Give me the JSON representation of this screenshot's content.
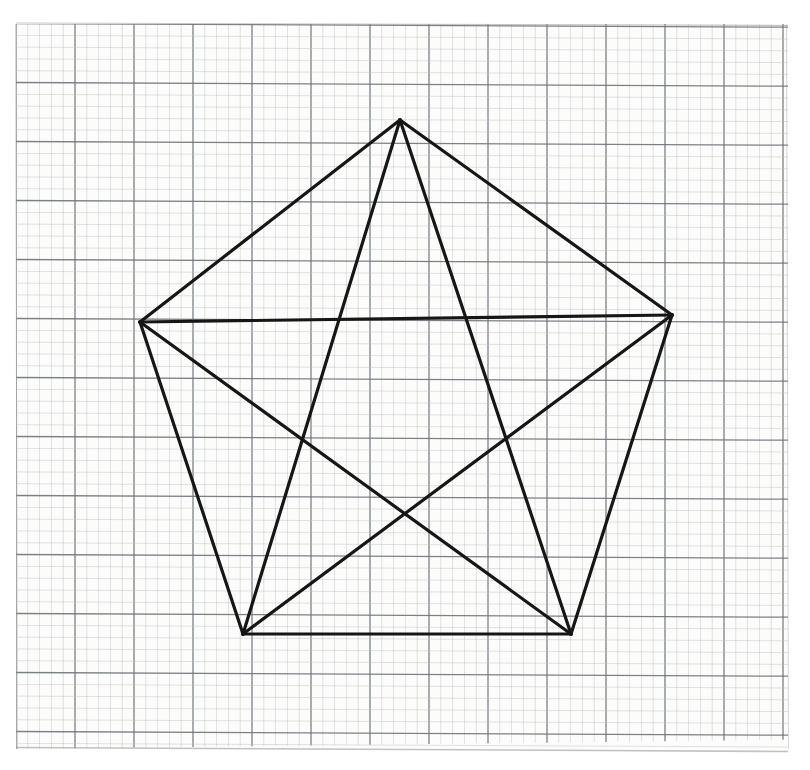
{
  "figure": {
    "shape_name": "pentagon-with-diagonals",
    "medium": "graph-paper-photograph"
  },
  "canvas": {
    "width": 810,
    "height": 770,
    "background_color": "#ffffff"
  },
  "paper": {
    "name": "graph-paper-sheet",
    "left": 16,
    "top": 24,
    "right": 788,
    "bottom": 749,
    "paper_color": "#fcfcfa",
    "minor_grid_color": "#b9bcc4",
    "major_grid_color": "#6f737c",
    "minor_spacing": 11.8,
    "major_every": 5,
    "minor_line_width": 0.6,
    "major_line_width": 1.3,
    "edge_shadow_color": "#9a9a9a"
  },
  "drawing": {
    "stroke_color": "#161616",
    "stroke_width": 3.2,
    "line_cap": "round",
    "line_join": "round"
  },
  "chart_data": {
    "type": "scatter",
    "xlabel": "",
    "ylabel": "",
    "xlim": [
      0,
      810
    ],
    "ylim": [
      770,
      0
    ],
    "grid": true,
    "legend": null,
    "vertices": [
      {
        "id": "A",
        "label": "top",
        "x": 400,
        "y": 120
      },
      {
        "id": "B",
        "label": "right",
        "x": 672,
        "y": 315
      },
      {
        "id": "C",
        "label": "bottom-right",
        "x": 571,
        "y": 634
      },
      {
        "id": "D",
        "label": "bottom-left",
        "x": 243,
        "y": 634
      },
      {
        "id": "E",
        "label": "left",
        "x": 140,
        "y": 322
      }
    ],
    "edges": [
      {
        "name": "edge-A-B",
        "from": "A",
        "to": "B"
      },
      {
        "name": "edge-B-C",
        "from": "B",
        "to": "C"
      },
      {
        "name": "edge-C-D",
        "from": "C",
        "to": "D"
      },
      {
        "name": "edge-D-E",
        "from": "D",
        "to": "E"
      },
      {
        "name": "edge-E-A",
        "from": "E",
        "to": "A"
      }
    ],
    "diagonals": [
      {
        "name": "diagonal-A-C",
        "from": "A",
        "to": "C"
      },
      {
        "name": "diagonal-A-D",
        "from": "A",
        "to": "D"
      },
      {
        "name": "diagonal-B-D",
        "from": "B",
        "to": "D"
      },
      {
        "name": "diagonal-B-E",
        "from": "B",
        "to": "E"
      },
      {
        "name": "diagonal-C-E",
        "from": "C",
        "to": "E"
      }
    ],
    "diagonal_count": 5,
    "edge_count": 5,
    "vertex_count": 5,
    "inner_crossing_center": {
      "x": 406,
      "y": 520
    }
  }
}
